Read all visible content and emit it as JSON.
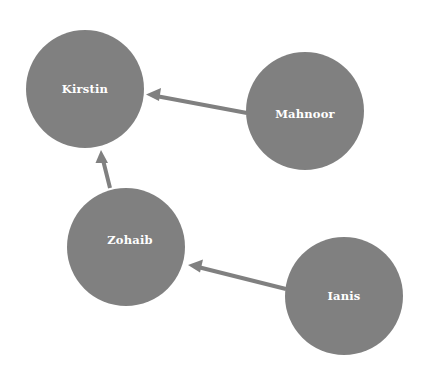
{
  "diagram": {
    "type": "directed-graph",
    "title": "",
    "background_color": "#ffffff",
    "node_fill_color": "#808080",
    "node_label_color": "#ffffff",
    "edge_color": "#808080",
    "canvas": {
      "width": 423,
      "height": 378
    },
    "nodes": [
      {
        "id": "kirstin",
        "label": "Kirstin",
        "cx": 85,
        "cy": 89,
        "r": 59
      },
      {
        "id": "mahnoor",
        "label": "Mahnoor",
        "cx": 305,
        "cy": 111,
        "r": 59
      },
      {
        "id": "zohaib",
        "label": "Zohaib",
        "cx": 126,
        "cy": 247,
        "r": 59
      },
      {
        "id": "ianis",
        "label": "Ianis",
        "cx": 344,
        "cy": 296,
        "r": 59
      }
    ],
    "edges": [
      {
        "id": "mahnoor-to-kirstin",
        "source": "mahnoor",
        "target": "kirstin",
        "x1": 247,
        "y1": 113,
        "x2": 146,
        "y2": 95,
        "directed": true
      },
      {
        "id": "zohaib-to-kirstin",
        "source": "zohaib",
        "target": "kirstin",
        "x1": 110,
        "y1": 188,
        "x2": 101,
        "y2": 150,
        "directed": true
      },
      {
        "id": "ianis-to-zohaib",
        "source": "ianis",
        "target": "zohaib",
        "x1": 286,
        "y1": 289,
        "x2": 188,
        "y2": 265,
        "directed": true
      }
    ]
  }
}
